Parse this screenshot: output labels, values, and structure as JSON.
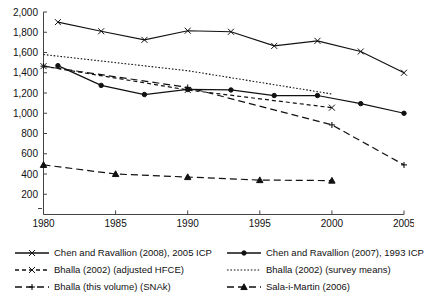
{
  "chart_data": {
    "type": "line",
    "title": "",
    "subtitle": "",
    "xlabel": "",
    "ylabel": "",
    "xlim": [
      1980,
      2005
    ],
    "ylim": [
      0,
      2000
    ],
    "grid": false,
    "legend_position": "bottom",
    "x_ticks": [
      "1980",
      "1985",
      "1990",
      "1995",
      "2000",
      "2005"
    ],
    "x_tick_values": [
      1980,
      1985,
      1990,
      1995,
      2000,
      2005
    ],
    "y_ticks": [
      "200",
      "400",
      "600",
      "800",
      "1,000",
      "1,200",
      "1,400",
      "1,600",
      "1,800",
      "2,000"
    ],
    "y_tick_values": [
      200,
      400,
      600,
      800,
      1000,
      1200,
      1400,
      1600,
      1800,
      2000
    ],
    "series": [
      {
        "name": "Chen and Ravallion (2008), 2005 ICP",
        "marker": "x",
        "dash": "none",
        "x": [
          1981,
          1984,
          1987,
          1990,
          1993,
          1996,
          1999,
          2002,
          2005
        ],
        "values": [
          1900,
          1810,
          1725,
          1815,
          1805,
          1665,
          1715,
          1610,
          1400
        ]
      },
      {
        "name": "Chen and Ravallion (2007), 1993 ICP",
        "marker": "circle",
        "dash": "none",
        "x": [
          1981,
          1984,
          1987,
          1990,
          1993,
          1996,
          1999,
          2002,
          2005
        ],
        "values": [
          1470,
          1275,
          1185,
          1235,
          1230,
          1175,
          1175,
          1095,
          1000
        ]
      },
      {
        "name": "Bhalla (2002) (adjusted HFCE)",
        "marker": "x",
        "dash": "dash-short",
        "x": [
          1980,
          1990,
          2000
        ],
        "values": [
          1465,
          1230,
          1055
        ]
      },
      {
        "name": "Bhalla (2002) (survey means)",
        "marker": "none",
        "dash": "dotted",
        "x": [
          1980,
          1990,
          2000
        ],
        "values": [
          1580,
          1420,
          1190
        ]
      },
      {
        "name": "Bhalla (this volume) (SNAk)",
        "marker": "plus",
        "dash": "dash-long",
        "x": [
          1980,
          1990,
          2000,
          2005
        ],
        "values": [
          1465,
          1255,
          885,
          490
        ]
      },
      {
        "name": "Sala-i-Martin (2006)",
        "marker": "triangle",
        "dash": "dash-long",
        "x": [
          1980,
          1985,
          1990,
          1995,
          2000
        ],
        "values": [
          490,
          400,
          370,
          340,
          335
        ]
      }
    ]
  },
  "legend": {
    "entries": [
      {
        "label": "Chen and Ravallion (2008), 2005 ICP",
        "marker": "x",
        "dash": "none"
      },
      {
        "label": "Chen and Ravallion (2007), 1993 ICP",
        "marker": "circle",
        "dash": "none"
      },
      {
        "label": "Bhalla (2002) (adjusted HFCE)",
        "marker": "x",
        "dash": "dash-short"
      },
      {
        "label": "Bhalla (2002) (survey means)",
        "marker": "none",
        "dash": "dotted"
      },
      {
        "label": "Bhalla (this volume) (SNAk)",
        "marker": "plus",
        "dash": "dash-long"
      },
      {
        "label": "Sala-i-Martin (2006)",
        "marker": "triangle",
        "dash": "dash-long"
      }
    ]
  },
  "colors": {
    "line": "#111111",
    "axis": "#444444",
    "background": "#ffffff"
  }
}
